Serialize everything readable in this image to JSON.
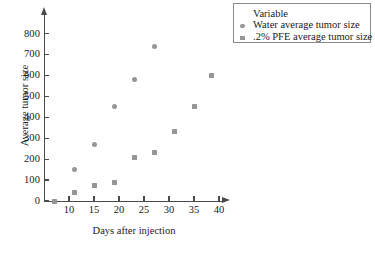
{
  "chart_data": {
    "type": "scatter",
    "title": "",
    "xlabel": "Days after injection",
    "ylabel": "Average tumor size",
    "xlim": [
      5,
      41
    ],
    "ylim": [
      0,
      840
    ],
    "grid": false,
    "legend_position": "top-right",
    "legend_title": "Variable",
    "xticks": [
      10,
      15,
      20,
      25,
      30,
      35,
      40
    ],
    "yticks": [
      0,
      100,
      200,
      300,
      400,
      500,
      600,
      700,
      800
    ],
    "series": [
      {
        "name": "Water average tumor size",
        "marker": "circle",
        "color": "#969696",
        "points": [
          {
            "x": 11,
            "y": 150
          },
          {
            "x": 15,
            "y": 270
          },
          {
            "x": 19,
            "y": 450
          },
          {
            "x": 23,
            "y": 580
          },
          {
            "x": 27,
            "y": 740
          }
        ]
      },
      {
        "name": ".2% PFE average tumor size",
        "marker": "square",
        "color": "#969696",
        "points": [
          {
            "x": 7,
            "y": 0
          },
          {
            "x": 11,
            "y": 40
          },
          {
            "x": 15,
            "y": 75
          },
          {
            "x": 19,
            "y": 90
          },
          {
            "x": 23,
            "y": 210
          },
          {
            "x": 27,
            "y": 230
          },
          {
            "x": 31,
            "y": 330
          },
          {
            "x": 35,
            "y": 450
          },
          {
            "x": 38.5,
            "y": 600
          }
        ]
      }
    ]
  },
  "legend": {
    "title": "Variable",
    "entries": [
      {
        "label": "Water average tumor size",
        "marker": "circle"
      },
      {
        "label": ".2% PFE average tumor size",
        "marker": "square"
      }
    ]
  },
  "axes": {
    "x_title": "Days after injection",
    "y_title": "Average tumor size",
    "x_tick_labels": [
      "10",
      "15",
      "20",
      "25",
      "30",
      "35",
      "40"
    ],
    "y_tick_labels": [
      "0",
      "100",
      "200",
      "300",
      "400",
      "500",
      "600",
      "700",
      "800"
    ]
  },
  "colors": {
    "marker": "#969696",
    "axis": "#4a4a4a",
    "legend_border": "#8a8a8a",
    "background": "#ffffff",
    "text": "#1a1a1a"
  }
}
